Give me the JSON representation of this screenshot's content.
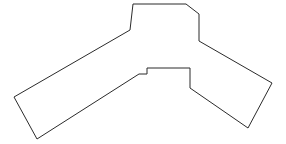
{
  "figure": {
    "shape_name": "chevron-polygon",
    "background_color": "#ffffff",
    "stroke_color": "#2b2b2b",
    "fill_color": "#ffffff",
    "stroke_width": 1,
    "canvas": {
      "width": 286,
      "height": 144
    },
    "vertex_count": 14,
    "vertices": [
      {
        "label": "A",
        "x": 133,
        "y": 4
      },
      {
        "label": "B",
        "x": 186,
        "y": 4
      },
      {
        "label": "C",
        "x": 199,
        "y": 14
      },
      {
        "label": "D",
        "x": 199,
        "y": 41
      },
      {
        "label": "E",
        "x": 272,
        "y": 83
      },
      {
        "label": "F",
        "x": 248,
        "y": 128
      },
      {
        "label": "G",
        "x": 190,
        "y": 88
      },
      {
        "label": "H",
        "x": 190,
        "y": 68
      },
      {
        "label": "I",
        "x": 147,
        "y": 68
      },
      {
        "label": "J",
        "x": 147,
        "y": 74
      },
      {
        "label": "K",
        "x": 139,
        "y": 74
      },
      {
        "label": "L",
        "x": 37,
        "y": 139
      },
      {
        "label": "M",
        "x": 14,
        "y": 97
      },
      {
        "label": "N",
        "x": 130,
        "y": 30
      }
    ],
    "path_d": "M 133 4 L 186 4 L 199 14 L 199 41 L 272 83 L 248 128 L 190 88 L 190 68 L 147 68 L 147 74 L 139 74 L 37 139 L 14 97 L 130 30 Z"
  }
}
